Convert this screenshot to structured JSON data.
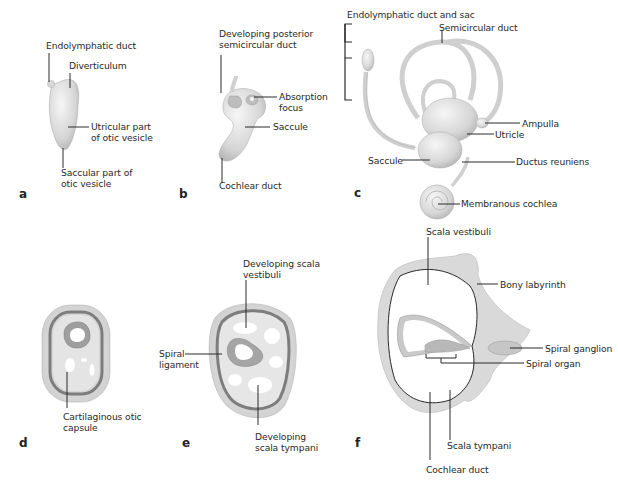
{
  "figure": {
    "panels": [
      {
        "id": "a",
        "letter": "a",
        "labels": [
          "Endolymphatic duct",
          "Diverticulum",
          "Utricular part\nof otic vesicle",
          "Saccular part of\notic vesicle"
        ]
      },
      {
        "id": "b",
        "letter": "b",
        "labels": [
          "Developing posterior\nsemicircular duct",
          "Absorption\nfocus",
          "Saccule",
          "Cochlear duct"
        ]
      },
      {
        "id": "c",
        "letter": "c",
        "labels": [
          "Endolymphatic duct and sac",
          "Semicircular duct",
          "Ampulla",
          "Utricle",
          "Saccule",
          "Ductus reuniens",
          "Membranous cochlea"
        ]
      },
      {
        "id": "d",
        "letter": "d",
        "labels": [
          "Cartilaginous otic\ncapsule"
        ]
      },
      {
        "id": "e",
        "letter": "e",
        "labels": [
          "Developing scala\nvestibuli",
          "Spiral\nligament",
          "Developing\nscala tympani"
        ]
      },
      {
        "id": "f",
        "letter": "f",
        "labels": [
          "Scala vestibuli",
          "Bony labyrinth",
          "Spiral ganglion",
          "Spiral organ",
          "Scala tympani",
          "Cochlear duct"
        ]
      }
    ]
  },
  "colors": {
    "membrane_light": "#e8e8e8",
    "membrane_mid": "#c9c9c9",
    "capsule_dark": "#7d7d7d",
    "leader_line": "#2a2a2a"
  }
}
